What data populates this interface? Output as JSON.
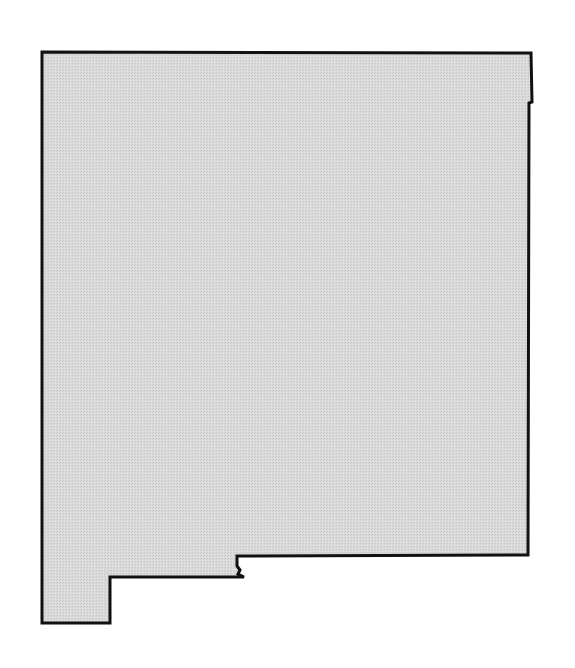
{
  "map": {
    "subject": "New Mexico state outline",
    "fill_color": "#d6d6d6",
    "stroke_color": "#111111",
    "stroke_width": 3,
    "outline_points": [
      [
        42,
        52
      ],
      [
        531,
        53
      ],
      [
        532,
        102
      ],
      [
        529,
        103
      ],
      [
        528,
        555
      ],
      [
        237,
        556
      ],
      [
        237,
        566
      ],
      [
        240,
        570
      ],
      [
        238,
        574
      ],
      [
        244,
        577
      ],
      [
        110,
        577
      ],
      [
        110,
        623
      ],
      [
        42,
        623
      ]
    ]
  }
}
